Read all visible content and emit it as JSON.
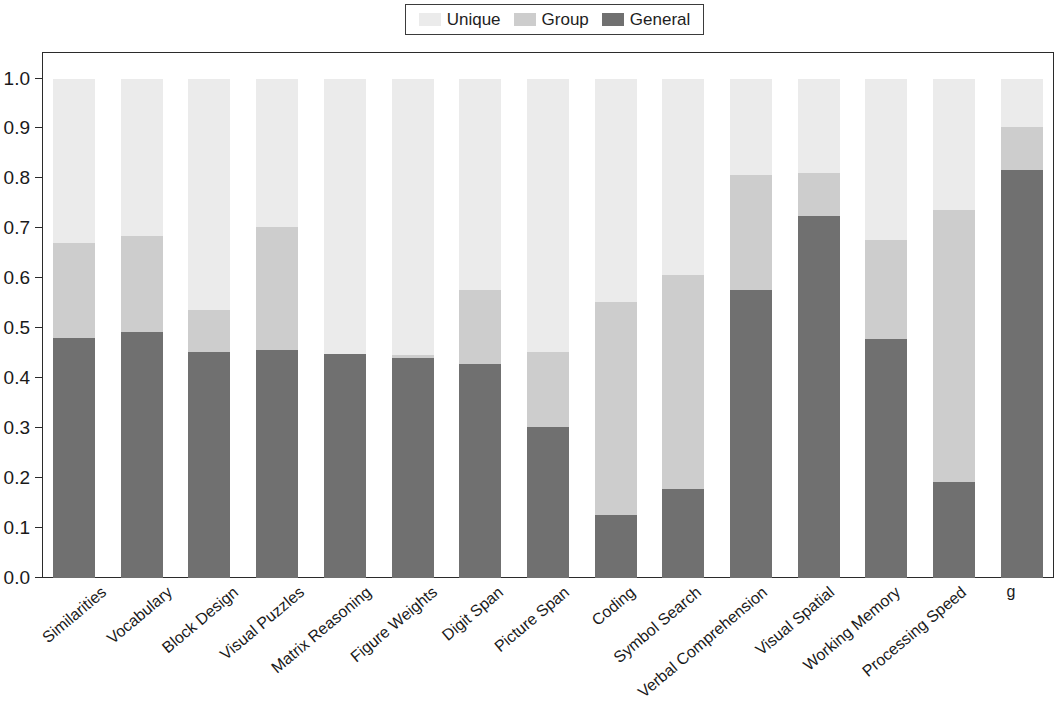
{
  "legend": {
    "entries": [
      {
        "label": "Unique",
        "color": "#ebebeb"
      },
      {
        "label": "Group",
        "color": "#cdcdcd"
      },
      {
        "label": "General",
        "color": "#707070"
      }
    ]
  },
  "axes": {
    "y_ticks": [
      "0.0",
      "0.1",
      "0.2",
      "0.3",
      "0.4",
      "0.5",
      "0.6",
      "0.7",
      "0.8",
      "0.9",
      "1.0"
    ]
  },
  "chart_data": {
    "type": "bar",
    "stacked": true,
    "normalized": true,
    "title": "",
    "xlabel": "",
    "ylabel": "",
    "ylim": [
      0.0,
      1.0
    ],
    "ytick_values": [
      0.0,
      0.1,
      0.2,
      0.3,
      0.4,
      0.5,
      0.6,
      0.7,
      0.8,
      0.9,
      1.0
    ],
    "grid": false,
    "legend_position": "top-center",
    "categories": [
      "Similarities",
      "Vocabulary",
      "Block Design",
      "Visual Puzzles",
      "Matrix Reasoning",
      "Figure Weights",
      "Digit Span",
      "Picture Span",
      "Coding",
      "Symbol Search",
      "Verbal Comprehension",
      "Visual Spatial",
      "Working Memory",
      "Processing Speed",
      "g"
    ],
    "series": [
      {
        "name": "General",
        "color": "#707070",
        "values": [
          0.48,
          0.494,
          0.453,
          0.457,
          0.449,
          0.44,
          0.428,
          0.302,
          0.126,
          0.179,
          0.578,
          0.725,
          0.479,
          0.192,
          0.817
        ]
      },
      {
        "name": "Group",
        "color": "#cdcdcd",
        "values": [
          0.192,
          0.192,
          0.084,
          0.246,
          0.0,
          0.006,
          0.15,
          0.15,
          0.427,
          0.429,
          0.23,
          0.087,
          0.199,
          0.545,
          0.086
        ]
      },
      {
        "name": "Unique",
        "color": "#ebebeb",
        "values": [
          0.328,
          0.314,
          0.463,
          0.297,
          0.551,
          0.554,
          0.422,
          0.548,
          0.447,
          0.392,
          0.192,
          0.188,
          0.322,
          0.263,
          0.097
        ]
      }
    ],
    "cumulative_tops": {
      "general": [
        0.48,
        0.494,
        0.453,
        0.457,
        0.449,
        0.44,
        0.428,
        0.302,
        0.126,
        0.179,
        0.578,
        0.725,
        0.479,
        0.192,
        0.817
      ],
      "group": [
        0.672,
        0.686,
        0.537,
        0.703,
        0.449,
        0.446,
        0.578,
        0.452,
        0.553,
        0.608,
        0.808,
        0.812,
        0.678,
        0.737,
        0.903
      ],
      "unique": [
        1.0,
        1.0,
        1.0,
        1.0,
        1.0,
        1.0,
        1.0,
        1.0,
        1.0,
        1.0,
        1.0,
        1.0,
        1.0,
        1.0,
        1.0
      ]
    }
  }
}
